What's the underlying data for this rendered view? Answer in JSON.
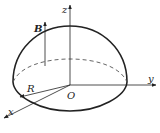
{
  "figure": {
    "type": "hemisphere-in-magnetic-field",
    "labels": {
      "z_axis": "z",
      "y_axis": "y",
      "x_axis": "x",
      "origin": "O",
      "radius": "R",
      "field": "B"
    },
    "colors": {
      "line": "#222222",
      "dashed": "#555555",
      "background": "#ffffff"
    }
  }
}
